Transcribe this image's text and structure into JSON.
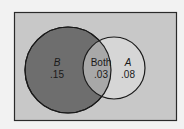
{
  "diagram": {
    "type": "venn",
    "sets": [
      {
        "id": "B",
        "label": "B",
        "value": ".15",
        "color": "#6e6e6e"
      },
      {
        "id": "A",
        "label": "A",
        "value": ".08",
        "color": "#d6d6d6"
      }
    ],
    "intersection": {
      "label": "Both",
      "value": ".03",
      "color": "#a8a8a8"
    },
    "universe_color": "#c8c8c8"
  }
}
